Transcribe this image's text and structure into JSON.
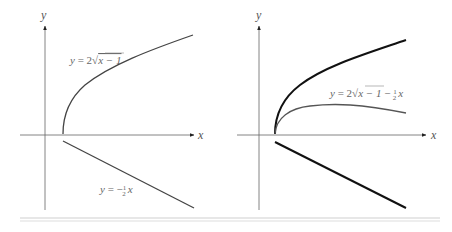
{
  "figure": {
    "left_panel": {
      "x_axis_label": "x",
      "y_axis_label": "y",
      "curve_label": {
        "prefix": "y = 2",
        "radicand": "x − 1"
      },
      "line_label": {
        "prefix": "y = −",
        "frac_num": "1",
        "frac_den": "2",
        "suffix": "x"
      }
    },
    "right_panel": {
      "x_axis_label": "x",
      "y_axis_label": "y",
      "curve_label": {
        "prefix": "y = 2",
        "radicand": "x − 1",
        "minus": " − ",
        "frac_num": "1",
        "frac_den": "2",
        "suffix": "x"
      }
    },
    "colors": {
      "axis": "#555555",
      "curve_thin": "#555555",
      "curve_thick": "#111111",
      "rule": "#cccccc"
    }
  }
}
